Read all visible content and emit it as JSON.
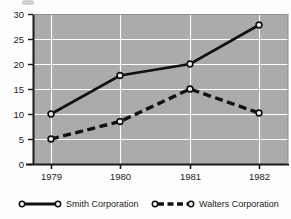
{
  "chart_data": {
    "type": "line",
    "title": "",
    "xlabel": "",
    "ylabel": "",
    "categories": [
      "1979",
      "1980",
      "1981",
      "1982"
    ],
    "ylim": [
      0,
      30
    ],
    "yticks": [
      0,
      5,
      10,
      15,
      20,
      25,
      30
    ],
    "grid": true,
    "legend_position": "bottom",
    "plot_background": "#ababab",
    "gridline_color": "#ffffff",
    "series": [
      {
        "name": "Smith Corporation",
        "values": [
          10,
          17.7,
          20,
          27.8
        ],
        "line_style": "solid",
        "marker": "open-circle",
        "color": "#111111"
      },
      {
        "name": "Walters Corporation",
        "values": [
          5,
          8.5,
          15,
          10.2
        ],
        "line_style": "dashed",
        "marker": "open-circle",
        "color": "#111111"
      }
    ]
  },
  "axis": {
    "y_tick_labels": [
      "30",
      "25",
      "20",
      "15",
      "10",
      "5",
      "0"
    ],
    "x_tick_labels": [
      "1979",
      "1980",
      "1981",
      "1982"
    ]
  },
  "legend": {
    "entries": [
      {
        "label": "Smith Corporation",
        "style": "solid"
      },
      {
        "label": "Walters Corporation",
        "style": "dashed"
      }
    ]
  }
}
